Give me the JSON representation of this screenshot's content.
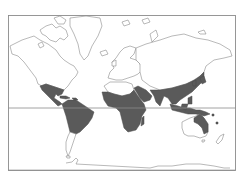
{
  "map": {
    "projection": "mercator",
    "style": "outline",
    "colors": {
      "background": "#ffffff",
      "land_outline": "#8a8a8a",
      "shaded_region": "#5a5a5a",
      "frame": "#8c8c8c",
      "equator": "#8c8c8c"
    },
    "lines": [
      "frame",
      "equator"
    ],
    "shaded_regions": [
      "Mexico and Central America",
      "Caribbean islands",
      "Northern and central South America",
      "Sub-Saharan Africa",
      "Madagascar",
      "Nile valley / Arabian Peninsula south",
      "Indian subcontinent",
      "Southern China and Southeast Asia",
      "Korea and Japan",
      "Philippines",
      "Indonesia and New Guinea",
      "Northern and eastern Australia"
    ],
    "unshaded_regions": [
      "North America (north)",
      "Greenland",
      "Europe",
      "Northern Asia",
      "Sahara",
      "Southern South America",
      "Southern Australia",
      "New Zealand",
      "Antarctica"
    ]
  }
}
